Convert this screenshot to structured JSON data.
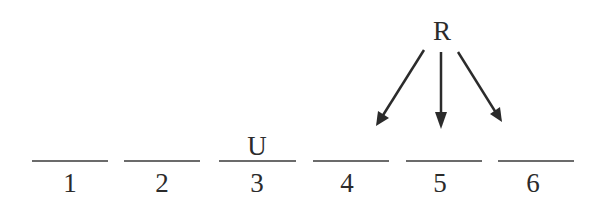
{
  "diagram": {
    "source_label": "R",
    "slots": [
      {
        "number": "1",
        "label_above": ""
      },
      {
        "number": "2",
        "label_above": ""
      },
      {
        "number": "3",
        "label_above": "U"
      },
      {
        "number": "4",
        "label_above": ""
      },
      {
        "number": "5",
        "label_above": ""
      },
      {
        "number": "6",
        "label_above": ""
      }
    ],
    "arrows": [
      {
        "from": "R",
        "to": "4"
      },
      {
        "from": "R",
        "to": "5"
      },
      {
        "from": "R",
        "to": "6"
      }
    ],
    "colors": {
      "ink": "#2b2b2b",
      "background": "#ffffff"
    }
  }
}
